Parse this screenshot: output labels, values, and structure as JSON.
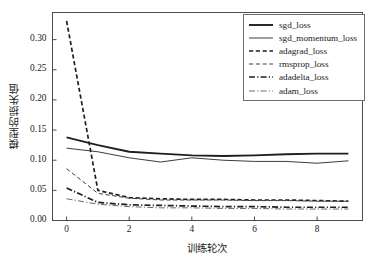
{
  "chart_data": {
    "type": "line",
    "title": "",
    "xlabel": "训练轮次",
    "ylabel": "模型的损失值",
    "xlim": [
      -0.45,
      9.45
    ],
    "ylim": [
      0.0,
      0.345
    ],
    "xticks": [
      0,
      2,
      4,
      6,
      8
    ],
    "xtick_labels": [
      "0",
      "2",
      "4",
      "6",
      "8"
    ],
    "yticks": [
      0.0,
      0.05,
      0.1,
      0.15,
      0.2,
      0.25,
      0.3
    ],
    "ytick_labels": [
      "0.00",
      "0.05",
      "0.10",
      "0.15",
      "0.20",
      "0.25",
      "0.30"
    ],
    "grid": false,
    "legend_position": "upper right",
    "x": [
      0,
      1,
      2,
      3,
      4,
      5,
      6,
      7,
      8,
      9
    ],
    "series": [
      {
        "name": "sgd_loss",
        "style": "solid",
        "width": 1.9,
        "color": "#1f1f1f",
        "values": [
          0.138,
          0.125,
          0.114,
          0.111,
          0.108,
          0.107,
          0.108,
          0.11,
          0.111,
          0.111
        ]
      },
      {
        "name": "sgd_momentum_loss",
        "style": "solid",
        "width": 1.0,
        "color": "#3c3c3c",
        "values": [
          0.12,
          0.114,
          0.104,
          0.097,
          0.104,
          0.1,
          0.098,
          0.098,
          0.095,
          0.099
        ]
      },
      {
        "name": "adagrad_loss",
        "style": "dashed",
        "width": 1.7,
        "color": "#1f1f1f",
        "values": [
          0.331,
          0.05,
          0.038,
          0.036,
          0.035,
          0.035,
          0.034,
          0.034,
          0.033,
          0.032
        ]
      },
      {
        "name": "rmsprop_loss",
        "style": "dashed-fine",
        "width": 1.0,
        "color": "#3c3c3c",
        "values": [
          0.086,
          0.045,
          0.037,
          0.034,
          0.034,
          0.034,
          0.033,
          0.033,
          0.032,
          0.032
        ]
      },
      {
        "name": "adadelta_loss",
        "style": "dash-dot",
        "width": 1.7,
        "color": "#1f1f1f",
        "values": [
          0.054,
          0.03,
          0.026,
          0.025,
          0.024,
          0.023,
          0.023,
          0.022,
          0.022,
          0.022
        ]
      },
      {
        "name": "adam_loss",
        "style": "dash-dot-fine",
        "width": 1.0,
        "color": "#6a6a6a",
        "values": [
          0.036,
          0.027,
          0.023,
          0.021,
          0.021,
          0.02,
          0.02,
          0.019,
          0.019,
          0.019
        ]
      }
    ]
  },
  "legend": {
    "items": [
      {
        "label": "sgd_loss"
      },
      {
        "label": "sgd_momentum_loss"
      },
      {
        "label": "adagrad_loss"
      },
      {
        "label": "rmsprop_loss"
      },
      {
        "label": "adadelta_loss"
      },
      {
        "label": "adam_loss"
      }
    ]
  },
  "colors": {
    "axis": "#4d4d4d",
    "text": "#1a1a1a",
    "background": "#ffffff"
  }
}
